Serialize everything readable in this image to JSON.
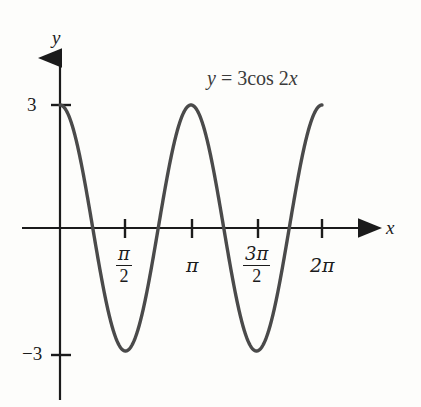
{
  "figure": {
    "background_color": "#fdfdfb",
    "curve_color": "#4a4a4a",
    "axis_color": "#1b1b1b",
    "equation_label": "y = 3cos 2x",
    "equation_parts": {
      "y": "y",
      "equals": " = ",
      "coefficient": "3cos 2",
      "x": "x"
    },
    "x_axis_name": "x",
    "y_axis_name": "y"
  },
  "chart_data": {
    "type": "line",
    "title": "y = 3cos 2x",
    "xlabel": "x",
    "ylabel": "y",
    "function": "y = 3cos(2x)",
    "amplitude": 3,
    "period": "π",
    "xlim": [
      0,
      6.2832
    ],
    "ylim": [
      -3,
      3
    ],
    "grid": false,
    "legend": "none",
    "x_ticks": [
      {
        "value": 1.5708,
        "label": "π/2",
        "numerator": "π",
        "denominator": "2",
        "is_fraction": true
      },
      {
        "value": 3.1416,
        "label": "π",
        "numerator": "π",
        "denominator": "",
        "is_fraction": false
      },
      {
        "value": 4.7124,
        "label": "3π/2",
        "numerator": "3π",
        "denominator": "2",
        "is_fraction": true
      },
      {
        "value": 6.2832,
        "label": "2π",
        "numerator": "2π",
        "denominator": "",
        "is_fraction": false
      }
    ],
    "y_ticks": [
      {
        "value": 3,
        "label": "3"
      },
      {
        "value": -3,
        "label": "−3"
      }
    ],
    "key_points": [
      {
        "x": 0,
        "y": 3,
        "note": "maximum"
      },
      {
        "x": 0.7854,
        "y": 0,
        "note": "zero"
      },
      {
        "x": 1.5708,
        "y": -3,
        "note": "minimum"
      },
      {
        "x": 2.3562,
        "y": 0,
        "note": "zero"
      },
      {
        "x": 3.1416,
        "y": 3,
        "note": "maximum"
      },
      {
        "x": 3.927,
        "y": 0,
        "note": "zero"
      },
      {
        "x": 4.7124,
        "y": -3,
        "note": "minimum"
      },
      {
        "x": 5.4978,
        "y": 0,
        "note": "zero"
      },
      {
        "x": 6.2832,
        "y": 3,
        "note": "maximum"
      }
    ]
  }
}
